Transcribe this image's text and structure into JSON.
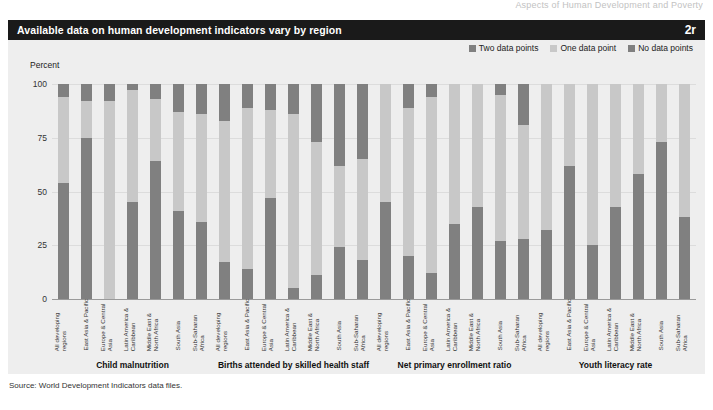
{
  "running_head": "Aspects of Human Development and Poverty",
  "title_bar": {
    "title": "Available data on human development indicators vary by region",
    "figure_number": "2r"
  },
  "legend": {
    "items": [
      {
        "label": "Two data points",
        "color": "#808080"
      },
      {
        "label": "One data point",
        "color": "#c8c8c8"
      },
      {
        "label": "No data points",
        "color": "#808080"
      }
    ]
  },
  "axis": {
    "y_label": "Percent",
    "y_ticks": [
      "0",
      "25",
      "50",
      "75",
      "100"
    ]
  },
  "source": "Source: World Development Indicators data files.",
  "colors": {
    "two_data_points": "#808080",
    "one_data_point": "#c8c8c8",
    "no_data_points": "#808080",
    "panel_background": "#eeeeee",
    "title_bar_background": "#1a1a1a",
    "plot_background": "#f2f2f2"
  },
  "chart_data": {
    "type": "bar",
    "title": "Available data on human development indicators vary by region",
    "xlabel": "",
    "ylabel": "Percent",
    "ylim": [
      0,
      100
    ],
    "grid": true,
    "legend_position": "top-right",
    "stacked": true,
    "categories": [
      "All developing regions",
      "East Asia & Pacific",
      "Europe & Central Asia",
      "Latin America & Caribbean",
      "Middle East & North Africa",
      "South Asia",
      "Sub-Saharan Africa"
    ],
    "series": [
      {
        "name": "Two data points",
        "color": "#808080"
      },
      {
        "name": "One data point",
        "color": "#c8c8c8"
      },
      {
        "name": "No data points",
        "color": "#808080"
      }
    ],
    "panels": [
      {
        "name": "Child malnutrition",
        "values": {
          "Two data points": [
            54,
            75,
            0,
            45,
            64,
            41,
            36
          ],
          "One data point": [
            40,
            17,
            92,
            52,
            29,
            46,
            50
          ],
          "No data points": [
            6,
            8,
            8,
            3,
            7,
            13,
            14
          ]
        }
      },
      {
        "name": "Births attended by skilled health staff",
        "values": {
          "Two data points": [
            17,
            14,
            47,
            5,
            11,
            24,
            18
          ],
          "One data point": [
            66,
            75,
            41,
            81,
            62,
            38,
            47
          ],
          "No data points": [
            17,
            11,
            12,
            14,
            27,
            38,
            35
          ]
        }
      },
      {
        "name": "Net primary enrollment ratio",
        "values": {
          "Two data points": [
            45,
            20,
            12,
            35,
            43,
            27,
            28
          ],
          "One data point": [
            55,
            69,
            82,
            65,
            57,
            68,
            53
          ],
          "No data points": [
            0,
            11,
            6,
            0,
            0,
            5,
            19
          ]
        }
      },
      {
        "name": "Youth literacy rate",
        "values": {
          "Two data points": [
            32,
            62,
            25,
            43,
            58,
            73,
            38
          ]
        }
      }
    ]
  },
  "groups": [
    {
      "title": "Child malnutrition",
      "bars": [
        {
          "region": "All developing regions",
          "segments": [
            {
              "value": 54,
              "type": "two"
            },
            {
              "value": 40,
              "type": "one"
            },
            {
              "value": 6,
              "type": "none"
            }
          ]
        },
        {
          "region": "East Asia & Pacific",
          "segments": [
            {
              "value": 75,
              "type": "two"
            },
            {
              "value": 17,
              "type": "one"
            },
            {
              "value": 8,
              "type": "none"
            }
          ]
        },
        {
          "region": "Europe & Central Asia",
          "segments": [
            {
              "value": 0,
              "type": "two"
            },
            {
              "value": 92,
              "type": "one"
            },
            {
              "value": 8,
              "type": "none"
            }
          ]
        },
        {
          "region": "Latin America & Caribbean",
          "segments": [
            {
              "value": 45,
              "type": "two"
            },
            {
              "value": 52,
              "type": "one"
            },
            {
              "value": 3,
              "type": "none"
            }
          ]
        },
        {
          "region": "Middle East & North Africa",
          "segments": [
            {
              "value": 64,
              "type": "two"
            },
            {
              "value": 29,
              "type": "one"
            },
            {
              "value": 7,
              "type": "none"
            }
          ]
        },
        {
          "region": "South Asia",
          "segments": [
            {
              "value": 41,
              "type": "two"
            },
            {
              "value": 46,
              "type": "one"
            },
            {
              "value": 13,
              "type": "none"
            }
          ]
        },
        {
          "region": "Sub-Saharan Africa",
          "segments": [
            {
              "value": 36,
              "type": "two"
            },
            {
              "value": 50,
              "type": "one"
            },
            {
              "value": 14,
              "type": "none"
            }
          ]
        }
      ]
    },
    {
      "title": "Births attended by skilled health staff",
      "bars": [
        {
          "region": "All developing regions",
          "segments": [
            {
              "value": 17,
              "type": "two"
            },
            {
              "value": 66,
              "type": "one"
            },
            {
              "value": 17,
              "type": "none"
            }
          ]
        },
        {
          "region": "East Asia & Pacific",
          "segments": [
            {
              "value": 14,
              "type": "two"
            },
            {
              "value": 75,
              "type": "one"
            },
            {
              "value": 11,
              "type": "none"
            }
          ]
        },
        {
          "region": "Europe & Central Asia",
          "segments": [
            {
              "value": 47,
              "type": "two"
            },
            {
              "value": 41,
              "type": "one"
            },
            {
              "value": 12,
              "type": "none"
            }
          ]
        },
        {
          "region": "Latin America & Caribbean",
          "segments": [
            {
              "value": 5,
              "type": "two"
            },
            {
              "value": 81,
              "type": "one"
            },
            {
              "value": 14,
              "type": "none"
            }
          ]
        },
        {
          "region": "Middle East & North Africa",
          "segments": [
            {
              "value": 11,
              "type": "two"
            },
            {
              "value": 62,
              "type": "one"
            },
            {
              "value": 27,
              "type": "none"
            }
          ]
        },
        {
          "region": "South Asia",
          "segments": [
            {
              "value": 24,
              "type": "two"
            },
            {
              "value": 38,
              "type": "one"
            },
            {
              "value": 38,
              "type": "none"
            }
          ]
        },
        {
          "region": "Sub-Saharan Africa",
          "segments": [
            {
              "value": 18,
              "type": "two"
            },
            {
              "value": 47,
              "type": "one"
            },
            {
              "value": 35,
              "type": "none"
            }
          ]
        }
      ]
    },
    {
      "title": "Net primary enrollment ratio",
      "bars": [
        {
          "region": "All developing regions",
          "segments": [
            {
              "value": 45,
              "type": "two"
            },
            {
              "value": 55,
              "type": "one"
            },
            {
              "value": 0,
              "type": "none"
            }
          ]
        },
        {
          "region": "East Asia & Pacific",
          "segments": [
            {
              "value": 20,
              "type": "two"
            },
            {
              "value": 69,
              "type": "one"
            },
            {
              "value": 11,
              "type": "none"
            }
          ]
        },
        {
          "region": "Europe & Central Asia",
          "segments": [
            {
              "value": 12,
              "type": "two"
            },
            {
              "value": 82,
              "type": "one"
            },
            {
              "value": 6,
              "type": "none"
            }
          ]
        },
        {
          "region": "Latin America & Caribbean",
          "segments": [
            {
              "value": 35,
              "type": "two"
            },
            {
              "value": 65,
              "type": "one"
            },
            {
              "value": 0,
              "type": "none"
            }
          ]
        },
        {
          "region": "Middle East & North Africa",
          "segments": [
            {
              "value": 43,
              "type": "two"
            },
            {
              "value": 57,
              "type": "one"
            },
            {
              "value": 0,
              "type": "none"
            }
          ]
        },
        {
          "region": "South Asia",
          "segments": [
            {
              "value": 27,
              "type": "two"
            },
            {
              "value": 68,
              "type": "one"
            },
            {
              "value": 5,
              "type": "none"
            }
          ]
        },
        {
          "region": "Sub-Saharan Africa",
          "segments": [
            {
              "value": 28,
              "type": "two"
            },
            {
              "value": 53,
              "type": "one"
            },
            {
              "value": 19,
              "type": "none"
            }
          ]
        }
      ]
    },
    {
      "title": "Youth literacy rate",
      "bars": [
        {
          "region": "All developing regions",
          "segments": [
            {
              "value": 32,
              "type": "two"
            },
            {
              "value": 68,
              "type": "one"
            },
            {
              "value": 0,
              "type": "none"
            }
          ]
        },
        {
          "region": "East Asia & Pacific",
          "segments": [
            {
              "value": 62,
              "type": "two"
            },
            {
              "value": 38,
              "type": "one"
            },
            {
              "value": 0,
              "type": "none"
            }
          ]
        },
        {
          "region": "Europe & Central Asia",
          "segments": [
            {
              "value": 25,
              "type": "two"
            },
            {
              "value": 75,
              "type": "one"
            },
            {
              "value": 0,
              "type": "none"
            }
          ]
        },
        {
          "region": "Latin America & Caribbean",
          "segments": [
            {
              "value": 43,
              "type": "two"
            },
            {
              "value": 57,
              "type": "one"
            },
            {
              "value": 0,
              "type": "none"
            }
          ]
        },
        {
          "region": "Middle East & North Africa",
          "segments": [
            {
              "value": 58,
              "type": "two"
            },
            {
              "value": 42,
              "type": "one"
            },
            {
              "value": 0,
              "type": "none"
            }
          ]
        },
        {
          "region": "South Asia",
          "segments": [
            {
              "value": 73,
              "type": "two"
            },
            {
              "value": 27,
              "type": "one"
            },
            {
              "value": 0,
              "type": "none"
            }
          ]
        },
        {
          "region": "Sub-Saharan Africa",
          "segments": [
            {
              "value": 38,
              "type": "two"
            },
            {
              "value": 62,
              "type": "one"
            },
            {
              "value": 0,
              "type": "none"
            }
          ]
        }
      ]
    }
  ]
}
